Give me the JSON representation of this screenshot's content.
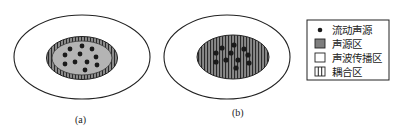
{
  "figure": {
    "panels": [
      {
        "id": "a",
        "label": "(a)",
        "outer_region": "声波传播区",
        "inner_region": "声源区",
        "boundary_region": "耦合区",
        "description": "coupling zone as a thin ring around the source region"
      },
      {
        "id": "b",
        "label": "(b)",
        "outer_region": "声波传播区",
        "inner_region": "耦合区",
        "description": "coupling zone covers the entire source region"
      }
    ],
    "legend": {
      "items": [
        {
          "icon": "dot-icon",
          "label": "流动声源"
        },
        {
          "icon": "filled-gray-square-icon",
          "label": "声源区"
        },
        {
          "icon": "empty-square-icon",
          "label": "声波传播区"
        },
        {
          "icon": "vertical-stripe-square-icon",
          "label": "耦合区"
        }
      ]
    },
    "colors": {
      "line": "#222222",
      "source_fill": "#8a8a8a",
      "source_light_fill": "#b4b4b4",
      "dot": "#1a1a1a",
      "background": "#ffffff"
    }
  }
}
